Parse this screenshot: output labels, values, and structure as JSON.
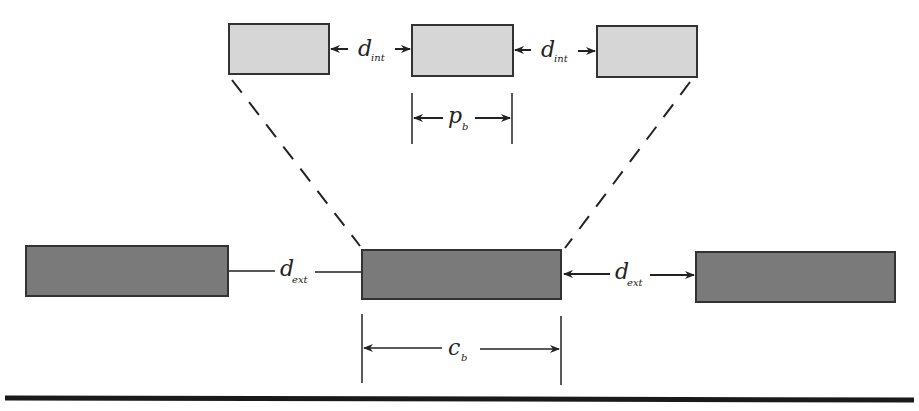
{
  "diagram": {
    "labels": {
      "d_int_left": {
        "main": "d",
        "sub": "int"
      },
      "d_int_right": {
        "main": "d",
        "sub": "int"
      },
      "p_b": {
        "main": "p",
        "sub": "b"
      },
      "d_ext_left": {
        "main": "d",
        "sub": "ext"
      },
      "d_ext_right": {
        "main": "d",
        "sub": "ext"
      },
      "c_b": {
        "main": "c",
        "sub": "b"
      }
    },
    "colors": {
      "inner_box_fill": "#d6d6d6",
      "outer_box_fill": "#7a7a7a",
      "stroke": "#333333",
      "ground_line": "#1a1a1a"
    }
  }
}
